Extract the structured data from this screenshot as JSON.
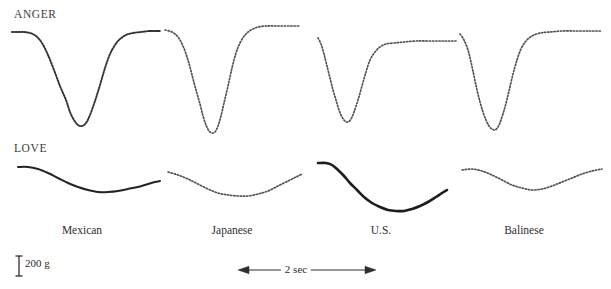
{
  "figure": {
    "rows": [
      {
        "id": "anger",
        "label": "ANGER"
      },
      {
        "id": "love",
        "label": "LOVE"
      }
    ],
    "culture_labels": [
      {
        "label": "Mexican",
        "x": 82
      },
      {
        "label": "Japanese",
        "x": 232
      },
      {
        "label": "U.S.",
        "x": 381
      },
      {
        "label": "Balinese",
        "x": 524
      }
    ],
    "scales": {
      "amplitude_label": "200 g",
      "time_label": "2 sec"
    }
  },
  "chart_data": {
    "type": "line",
    "title": "",
    "subtitle": "",
    "xlabel": "2 sec",
    "ylabel": "200 g",
    "grid": false,
    "legend": "none",
    "x_scale_bar_seconds": 2,
    "y_scale_bar_grams": 200,
    "panels": [
      {
        "emotion": "ANGER",
        "culture": "Mexican",
        "style": "solid-dotted",
        "baseline_y": 32,
        "trough_y": 125,
        "depth_grams": 620,
        "points": [
          [
            12,
            32
          ],
          [
            18,
            32
          ],
          [
            24,
            32
          ],
          [
            30,
            33
          ],
          [
            36,
            36
          ],
          [
            42,
            43
          ],
          [
            48,
            55
          ],
          [
            54,
            70
          ],
          [
            60,
            86
          ],
          [
            66,
            100
          ],
          [
            70,
            112
          ],
          [
            74,
            120
          ],
          [
            78,
            125
          ],
          [
            82,
            126
          ],
          [
            86,
            123
          ],
          [
            90,
            115
          ],
          [
            95,
            101
          ],
          [
            100,
            85
          ],
          [
            105,
            68
          ],
          [
            110,
            54
          ],
          [
            115,
            45
          ],
          [
            120,
            39
          ],
          [
            126,
            35
          ],
          [
            133,
            33
          ],
          [
            141,
            32
          ],
          [
            150,
            31
          ],
          [
            160,
            31
          ],
          [
            148,
            31
          ]
        ]
      },
      {
        "emotion": "ANGER",
        "culture": "Japanese",
        "style": "dotted",
        "baseline_y": 28,
        "trough_y": 133,
        "depth_grams": 700,
        "points": [
          [
            165,
            30
          ],
          [
            172,
            32
          ],
          [
            178,
            37
          ],
          [
            183,
            46
          ],
          [
            188,
            60
          ],
          [
            192,
            75
          ],
          [
            196,
            90
          ],
          [
            200,
            104
          ],
          [
            203,
            116
          ],
          [
            206,
            125
          ],
          [
            209,
            131
          ],
          [
            212,
            133
          ],
          [
            215,
            132
          ],
          [
            218,
            126
          ],
          [
            221,
            116
          ],
          [
            224,
            103
          ],
          [
            228,
            86
          ],
          [
            232,
            68
          ],
          [
            236,
            53
          ],
          [
            240,
            43
          ],
          [
            245,
            35
          ],
          [
            251,
            30
          ],
          [
            258,
            27
          ],
          [
            266,
            26
          ],
          [
            276,
            26
          ],
          [
            288,
            26
          ],
          [
            300,
            26
          ]
        ]
      },
      {
        "emotion": "ANGER",
        "culture": "U.S.",
        "style": "dotted",
        "baseline_y": 42,
        "trough_y": 122,
        "depth_grams": 530,
        "points": [
          [
            318,
            38
          ],
          [
            321,
            44
          ],
          [
            324,
            54
          ],
          [
            327,
            66
          ],
          [
            330,
            78
          ],
          [
            333,
            90
          ],
          [
            336,
            100
          ],
          [
            339,
            110
          ],
          [
            342,
            117
          ],
          [
            345,
            121
          ],
          [
            348,
            122
          ],
          [
            351,
            119
          ],
          [
            354,
            112
          ],
          [
            358,
            100
          ],
          [
            362,
            86
          ],
          [
            366,
            72
          ],
          [
            370,
            60
          ],
          [
            375,
            52
          ],
          [
            380,
            47
          ],
          [
            386,
            44
          ],
          [
            394,
            43
          ],
          [
            404,
            42
          ],
          [
            416,
            41
          ],
          [
            430,
            41
          ],
          [
            444,
            41
          ],
          [
            456,
            41
          ]
        ]
      },
      {
        "emotion": "ANGER",
        "culture": "Balinese",
        "style": "dotted",
        "baseline_y": 32,
        "trough_y": 130,
        "depth_grams": 650,
        "points": [
          [
            460,
            34
          ],
          [
            464,
            40
          ],
          [
            468,
            50
          ],
          [
            471,
            62
          ],
          [
            474,
            76
          ],
          [
            477,
            90
          ],
          [
            480,
            102
          ],
          [
            483,
            112
          ],
          [
            486,
            120
          ],
          [
            489,
            126
          ],
          [
            492,
            129
          ],
          [
            495,
            130
          ],
          [
            498,
            127
          ],
          [
            501,
            120
          ],
          [
            505,
            107
          ],
          [
            509,
            91
          ],
          [
            513,
            74
          ],
          [
            517,
            60
          ],
          [
            521,
            49
          ],
          [
            526,
            41
          ],
          [
            532,
            36
          ],
          [
            540,
            33
          ],
          [
            550,
            32
          ],
          [
            562,
            31
          ],
          [
            576,
            31
          ],
          [
            590,
            31
          ],
          [
            602,
            31
          ]
        ]
      },
      {
        "emotion": "LOVE",
        "culture": "Mexican",
        "style": "solid",
        "baseline_y": 168,
        "trough_y": 192,
        "depth_grams": 160,
        "points": [
          [
            18,
            167
          ],
          [
            28,
            167
          ],
          [
            38,
            169
          ],
          [
            48,
            173
          ],
          [
            58,
            178
          ],
          [
            68,
            183
          ],
          [
            78,
            187
          ],
          [
            88,
            190
          ],
          [
            98,
            192
          ],
          [
            108,
            192
          ],
          [
            118,
            191
          ],
          [
            128,
            189
          ],
          [
            138,
            187
          ],
          [
            148,
            184
          ],
          [
            155,
            182
          ],
          [
            160,
            181
          ]
        ]
      },
      {
        "emotion": "LOVE",
        "culture": "Japanese",
        "style": "dotted",
        "baseline_y": 173,
        "trough_y": 196,
        "depth_grams": 150,
        "points": [
          [
            168,
            172
          ],
          [
            178,
            175
          ],
          [
            188,
            179
          ],
          [
            198,
            184
          ],
          [
            208,
            189
          ],
          [
            218,
            193
          ],
          [
            228,
            195
          ],
          [
            238,
            196
          ],
          [
            248,
            196
          ],
          [
            258,
            194
          ],
          [
            268,
            191
          ],
          [
            278,
            186
          ],
          [
            288,
            181
          ],
          [
            296,
            177
          ],
          [
            302,
            174
          ]
        ]
      },
      {
        "emotion": "LOVE",
        "culture": "U.S.",
        "style": "solid-bold",
        "baseline_y": 164,
        "trough_y": 211,
        "depth_grams": 310,
        "points": [
          [
            318,
            163
          ],
          [
            326,
            163
          ],
          [
            332,
            165
          ],
          [
            338,
            170
          ],
          [
            344,
            176
          ],
          [
            350,
            183
          ],
          [
            357,
            190
          ],
          [
            364,
            197
          ],
          [
            372,
            203
          ],
          [
            380,
            207
          ],
          [
            388,
            210
          ],
          [
            396,
            211
          ],
          [
            404,
            211
          ],
          [
            412,
            209
          ],
          [
            420,
            206
          ],
          [
            428,
            202
          ],
          [
            436,
            197
          ],
          [
            442,
            193
          ],
          [
            447,
            190
          ]
        ]
      },
      {
        "emotion": "LOVE",
        "culture": "Balinese",
        "style": "dotted",
        "baseline_y": 169,
        "trough_y": 190,
        "depth_grams": 140,
        "points": [
          [
            462,
            170
          ],
          [
            472,
            169
          ],
          [
            482,
            171
          ],
          [
            492,
            175
          ],
          [
            502,
            180
          ],
          [
            512,
            185
          ],
          [
            522,
            188
          ],
          [
            532,
            190
          ],
          [
            542,
            189
          ],
          [
            552,
            186
          ],
          [
            562,
            182
          ],
          [
            572,
            178
          ],
          [
            582,
            174
          ],
          [
            592,
            171
          ],
          [
            602,
            169
          ]
        ]
      }
    ]
  }
}
